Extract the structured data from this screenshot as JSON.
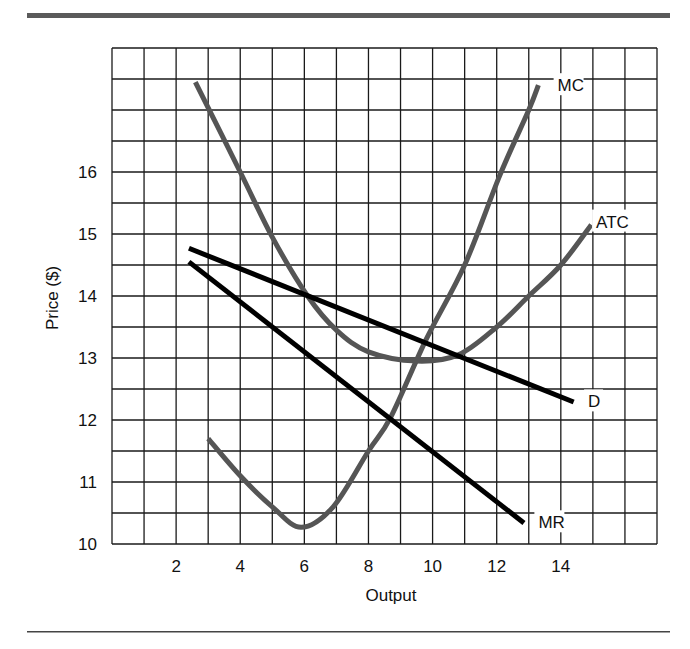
{
  "chart_data": {
    "type": "line",
    "title": "",
    "xlabel": "Output",
    "ylabel": "Price ($)",
    "xlim": [
      0,
      17
    ],
    "ylim": [
      10,
      18
    ],
    "grid": true,
    "grid_x_step": 1,
    "grid_y_step": 0.5,
    "x_ticks": [
      2,
      4,
      6,
      8,
      10,
      12,
      14
    ],
    "y_ticks": [
      10,
      11,
      12,
      13,
      14,
      15,
      16
    ],
    "legend_position": "inline labels at curve ends",
    "series": [
      {
        "name": "MC",
        "color": "#555555",
        "points": [
          [
            3.0,
            11.7
          ],
          [
            4.0,
            11.1
          ],
          [
            5.0,
            10.6
          ],
          [
            5.9,
            10.27
          ],
          [
            6.9,
            10.6
          ],
          [
            8.0,
            11.5
          ],
          [
            8.7,
            12.05
          ],
          [
            9.8,
            13.3
          ],
          [
            11.0,
            14.5
          ],
          [
            12.1,
            15.95
          ],
          [
            13.0,
            17.0
          ],
          [
            13.3,
            17.4
          ]
        ]
      },
      {
        "name": "ATC",
        "color": "#555555",
        "points": [
          [
            2.6,
            17.45
          ],
          [
            4.0,
            16.0
          ],
          [
            5.0,
            14.95
          ],
          [
            6.1,
            14.0
          ],
          [
            7.0,
            13.45
          ],
          [
            8.0,
            13.1
          ],
          [
            9.5,
            12.95
          ],
          [
            10.8,
            13.05
          ],
          [
            12.0,
            13.5
          ],
          [
            13.0,
            14.0
          ],
          [
            14.0,
            14.5
          ],
          [
            14.95,
            15.15
          ]
        ]
      },
      {
        "name": "D",
        "color": "#000000",
        "points": [
          [
            2.4,
            14.77
          ],
          [
            6.1,
            14.0
          ],
          [
            9.8,
            13.3
          ],
          [
            10.8,
            13.05
          ],
          [
            14.4,
            12.29
          ]
        ]
      },
      {
        "name": "MR",
        "color": "#000000",
        "points": [
          [
            2.4,
            14.55
          ],
          [
            8.7,
            12.05
          ],
          [
            12.85,
            10.34
          ]
        ]
      }
    ],
    "annotations": [
      {
        "text": "MC",
        "x": 13.9,
        "y": 17.4
      },
      {
        "text": "ATC",
        "x": 15.1,
        "y": 15.2
      },
      {
        "text": "D",
        "x": 14.85,
        "y": 12.3
      },
      {
        "text": "MR",
        "x": 13.3,
        "y": 10.35
      }
    ]
  }
}
